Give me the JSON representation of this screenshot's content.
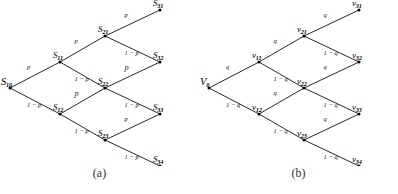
{
  "figure": {
    "panels": [
      {
        "id": "panel-a",
        "caption": "(a)",
        "prob_up": "p",
        "prob_down": "1 − p",
        "nodes": [
          {
            "key": "root",
            "base": "S",
            "sub": "10",
            "x": 10,
            "y": 88,
            "size": "big"
          },
          {
            "key": "n11",
            "base": "S",
            "sub": "11",
            "x": 60,
            "y": 62,
            "size": "norm"
          },
          {
            "key": "n12",
            "base": "S",
            "sub": "12",
            "x": 60,
            "y": 114,
            "size": "norm"
          },
          {
            "key": "n21",
            "base": "S",
            "sub": "21",
            "x": 105,
            "y": 36,
            "size": "norm"
          },
          {
            "key": "n22",
            "base": "S",
            "sub": "22",
            "x": 105,
            "y": 88,
            "size": "norm"
          },
          {
            "key": "n23",
            "base": "S",
            "sub": "23",
            "x": 105,
            "y": 140,
            "size": "norm"
          },
          {
            "key": "n31",
            "base": "S",
            "sub": "31",
            "x": 160,
            "y": 10,
            "size": "norm"
          },
          {
            "key": "n32",
            "base": "S",
            "sub": "32",
            "x": 160,
            "y": 62,
            "size": "norm"
          },
          {
            "key": "n33",
            "base": "S",
            "sub": "33",
            "x": 160,
            "y": 114,
            "size": "norm"
          },
          {
            "key": "n34",
            "base": "S",
            "sub": "34",
            "x": 160,
            "y": 166,
            "size": "norm"
          }
        ],
        "edges": [
          {
            "from": "root",
            "to": "n11",
            "label": "p",
            "size": "norm"
          },
          {
            "from": "root",
            "to": "n12",
            "label": "1 − p",
            "size": "norm"
          },
          {
            "from": "n11",
            "to": "n21",
            "label": "p",
            "size": "norm"
          },
          {
            "from": "n11",
            "to": "n22",
            "label": "1 − p",
            "size": "norm"
          },
          {
            "from": "n12",
            "to": "n22",
            "label": "p",
            "size": "big"
          },
          {
            "from": "n12",
            "to": "n23",
            "label": "1 − p",
            "size": "norm"
          },
          {
            "from": "n21",
            "to": "n31",
            "label": "p",
            "size": "norm"
          },
          {
            "from": "n21",
            "to": "n32",
            "label": "1 − p",
            "size": "norm"
          },
          {
            "from": "n22",
            "to": "n32",
            "label": "p",
            "size": "big"
          },
          {
            "from": "n22",
            "to": "n33",
            "label": "1 − p",
            "size": "norm"
          },
          {
            "from": "n23",
            "to": "n33",
            "label": "p",
            "size": "norm"
          },
          {
            "from": "n23",
            "to": "n34",
            "label": "1 − p",
            "size": "norm"
          }
        ]
      },
      {
        "id": "panel-b",
        "caption": "(b)",
        "prob_up": "q",
        "prob_down": "1 − q",
        "nodes": [
          {
            "key": "root",
            "base": "V",
            "sub": "0",
            "x": 10,
            "y": 88,
            "size": "big"
          },
          {
            "key": "n11",
            "base": "v",
            "sub": "11",
            "x": 60,
            "y": 62,
            "size": "norm"
          },
          {
            "key": "n12",
            "base": "v",
            "sub": "12",
            "x": 60,
            "y": 114,
            "size": "norm"
          },
          {
            "key": "n21",
            "base": "v",
            "sub": "21",
            "x": 105,
            "y": 36,
            "size": "norm"
          },
          {
            "key": "n22",
            "base": "v",
            "sub": "22",
            "x": 105,
            "y": 88,
            "size": "norm"
          },
          {
            "key": "n23",
            "base": "v",
            "sub": "23",
            "x": 105,
            "y": 140,
            "size": "norm"
          },
          {
            "key": "n31",
            "base": "v",
            "sub": "31",
            "x": 160,
            "y": 10,
            "size": "norm"
          },
          {
            "key": "n32",
            "base": "v",
            "sub": "32",
            "x": 160,
            "y": 62,
            "size": "norm"
          },
          {
            "key": "n33",
            "base": "v",
            "sub": "33",
            "x": 160,
            "y": 114,
            "size": "norm"
          },
          {
            "key": "n34",
            "base": "v",
            "sub": "34",
            "x": 160,
            "y": 166,
            "size": "norm"
          }
        ],
        "edges": [
          {
            "from": "root",
            "to": "n11",
            "label": "q",
            "size": "norm"
          },
          {
            "from": "root",
            "to": "n12",
            "label": "1 − q",
            "size": "norm"
          },
          {
            "from": "n11",
            "to": "n21",
            "label": "q",
            "size": "norm"
          },
          {
            "from": "n11",
            "to": "n22",
            "label": "1 − q",
            "size": "norm"
          },
          {
            "from": "n12",
            "to": "n22",
            "label": "q",
            "size": "norm"
          },
          {
            "from": "n12",
            "to": "n23",
            "label": "1 − q",
            "size": "norm"
          },
          {
            "from": "n21",
            "to": "n31",
            "label": "q",
            "size": "norm"
          },
          {
            "from": "n21",
            "to": "n32",
            "label": "1 − q",
            "size": "norm"
          },
          {
            "from": "n22",
            "to": "n32",
            "label": "q",
            "size": "norm"
          },
          {
            "from": "n22",
            "to": "n33",
            "label": "1 − q",
            "size": "norm"
          },
          {
            "from": "n23",
            "to": "n33",
            "label": "q",
            "size": "norm"
          },
          {
            "from": "n23",
            "to": "n34",
            "label": "1 − q",
            "size": "norm"
          }
        ]
      }
    ]
  }
}
